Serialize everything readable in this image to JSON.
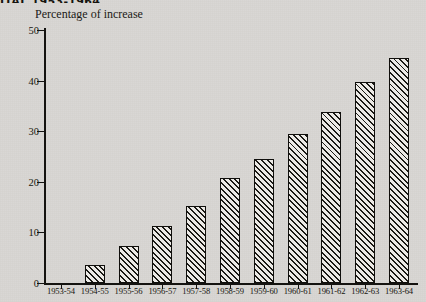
{
  "headline": {
    "text": "ITAL 1953-1964"
  },
  "chart_data": {
    "type": "bar",
    "title": "",
    "ylabel": "Percentage of increase",
    "xlabel": "",
    "categories": [
      "1953-54",
      "1954-55",
      "1955-56",
      "1956-57",
      "1957-58",
      "1958-59",
      "1959-60",
      "1960-61",
      "1961-62",
      "1962-63",
      "1963-64"
    ],
    "values": [
      0,
      3.6,
      7.3,
      11.2,
      15.3,
      20.8,
      24.6,
      29.5,
      33.8,
      39.7,
      44.5
    ],
    "ylim": [
      0,
      50
    ],
    "yticks": [
      0,
      10,
      20,
      30,
      40,
      50
    ],
    "ytick_labels": [
      "0",
      "10",
      "20",
      "30",
      "40",
      "50"
    ],
    "grid": false,
    "legend": null,
    "bar_style": {
      "fill": "diagonal-hatch",
      "hatch_color": "#1b1a16",
      "face_color": "#eceae6",
      "edge_color": "#100f0c"
    }
  },
  "page": {
    "background_color": "#d8d6d2",
    "ink_color": "#15140f"
  }
}
